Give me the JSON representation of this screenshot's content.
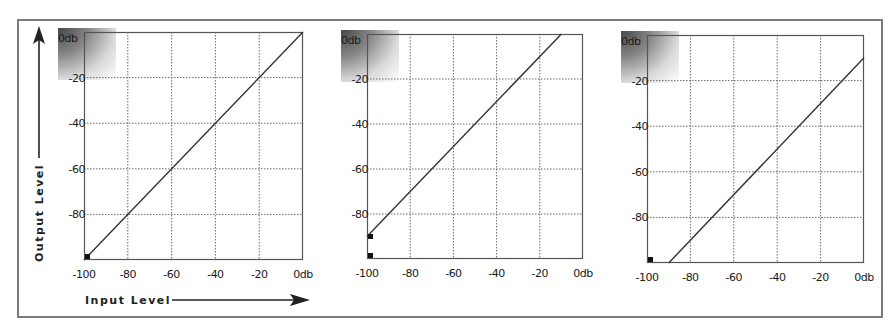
{
  "axis_titles": {
    "x": "Input Level",
    "y": "Output Level"
  },
  "colors": {
    "frame": "#7a7a7a",
    "plot_border": "#555555",
    "grid": "#6a6a6a",
    "curve": "#333333",
    "marker": "#111111"
  },
  "ticks": {
    "x": [
      "-100",
      "-80",
      "-60",
      "-40",
      "-20",
      "0db"
    ],
    "y": [
      "0db",
      "-20",
      "-40",
      "-60",
      "-80"
    ]
  },
  "chart_data": [
    {
      "type": "line",
      "title": "Unity gain (no change)",
      "xlabel": "Input Level",
      "ylabel": "Output Level",
      "xlim": [
        -100,
        0
      ],
      "ylim": [
        -100,
        0
      ],
      "grid": true,
      "x_ticks": [
        "-100",
        "-80",
        "-60",
        "-40",
        "-20",
        "0db"
      ],
      "y_ticks": [
        "0db",
        "-20",
        "-40",
        "-60",
        "-80"
      ],
      "series": [
        {
          "name": "transfer",
          "x": [
            -100,
            0
          ],
          "y": [
            -100,
            0
          ]
        }
      ],
      "markers": [
        {
          "x": -100,
          "y": -100
        }
      ]
    },
    {
      "type": "line",
      "title": "+10 dB gain",
      "xlabel": "Input Level",
      "ylabel": "Output Level",
      "xlim": [
        -100,
        0
      ],
      "ylim": [
        -100,
        0
      ],
      "grid": true,
      "x_ticks": [
        "-100",
        "-80",
        "-60",
        "-40",
        "-20",
        "0db"
      ],
      "y_ticks": [
        "0db",
        "-20",
        "-40",
        "-60",
        "-80"
      ],
      "series": [
        {
          "name": "transfer",
          "x": [
            -100,
            -10
          ],
          "y": [
            -90,
            0
          ]
        }
      ],
      "markers": [
        {
          "x": -100,
          "y": -90
        },
        {
          "x": -100,
          "y": -100
        }
      ]
    },
    {
      "type": "line",
      "title": "-10 dB gain",
      "xlabel": "Input Level",
      "ylabel": "Output Level",
      "xlim": [
        -100,
        0
      ],
      "ylim": [
        -100,
        0
      ],
      "grid": true,
      "x_ticks": [
        "-100",
        "-80",
        "-60",
        "-40",
        "-20",
        "0db"
      ],
      "y_ticks": [
        "0db",
        "-20",
        "-40",
        "-60",
        "-80"
      ],
      "series": [
        {
          "name": "transfer",
          "x": [
            -90,
            0
          ],
          "y": [
            -100,
            -10
          ]
        }
      ],
      "markers": [
        {
          "x": -100,
          "y": -100
        }
      ]
    }
  ]
}
